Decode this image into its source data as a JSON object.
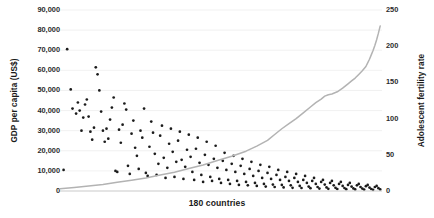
{
  "chart_data": {
    "type": "scatter",
    "title": "",
    "xlabel": "180 countries",
    "ylabel": "GDP per capita (US$)",
    "y2label": "Adolescent fertility rate",
    "grid": true,
    "legend": "none",
    "xlim": [
      0,
      180
    ],
    "ylim": [
      0,
      90000
    ],
    "y2lim": [
      0,
      250
    ],
    "yticks": [
      0,
      10000,
      20000,
      30000,
      40000,
      50000,
      60000,
      70000,
      80000,
      90000
    ],
    "ytick_labels": [
      "0",
      "10,000",
      "20,000",
      "30,000",
      "40,000",
      "50,000",
      "60,000",
      "70,000",
      "80,000",
      "90,000"
    ],
    "y2ticks": [
      0,
      50,
      100,
      150,
      200,
      250
    ],
    "y2tick_labels": [
      "0",
      "50",
      "100",
      "150",
      "200",
      "250"
    ],
    "xticks": [],
    "xtick_labels": [],
    "series": [
      {
        "name": "GDP per capita (US$)",
        "axis": "left",
        "type": "scatter",
        "marker": "circle",
        "color": "#1b1b1b",
        "points": [
          [
            2,
            10500
          ],
          [
            4,
            70500
          ],
          [
            6,
            50500
          ],
          [
            7,
            41000
          ],
          [
            9,
            38500
          ],
          [
            10,
            44000
          ],
          [
            11,
            40000
          ],
          [
            12,
            30000
          ],
          [
            13,
            36500
          ],
          [
            14,
            43000
          ],
          [
            15,
            45500
          ],
          [
            16,
            37000
          ],
          [
            17,
            29500
          ],
          [
            18,
            25500
          ],
          [
            19,
            31500
          ],
          [
            20,
            61500
          ],
          [
            21,
            58000
          ],
          [
            22,
            50000
          ],
          [
            23,
            39500
          ],
          [
            24,
            30000
          ],
          [
            25,
            24500
          ],
          [
            26,
            31000
          ],
          [
            27,
            26000
          ],
          [
            28,
            35500
          ],
          [
            29,
            41500
          ],
          [
            30,
            46500
          ],
          [
            31,
            10000
          ],
          [
            32,
            9500
          ],
          [
            33,
            30500
          ],
          [
            34,
            24000
          ],
          [
            35,
            33000
          ],
          [
            36,
            43500
          ],
          [
            37,
            40500
          ],
          [
            38,
            12500
          ],
          [
            39,
            8500
          ],
          [
            40,
            28500
          ],
          [
            41,
            35000
          ],
          [
            42,
            21500
          ],
          [
            43,
            17500
          ],
          [
            44,
            11000
          ],
          [
            45,
            30000
          ],
          [
            46,
            26500
          ],
          [
            47,
            41000
          ],
          [
            48,
            9000
          ],
          [
            49,
            7500
          ],
          [
            50,
            22000
          ],
          [
            51,
            34500
          ],
          [
            52,
            29000
          ],
          [
            53,
            18500
          ],
          [
            54,
            8000
          ],
          [
            55,
            13500
          ],
          [
            56,
            27500
          ],
          [
            57,
            32500
          ],
          [
            58,
            16500
          ],
          [
            59,
            6500
          ],
          [
            60,
            11500
          ],
          [
            61,
            23500
          ],
          [
            62,
            31000
          ],
          [
            63,
            19500
          ],
          [
            64,
            7000
          ],
          [
            65,
            14500
          ],
          [
            66,
            25000
          ],
          [
            67,
            29500
          ],
          [
            68,
            15500
          ],
          [
            69,
            6000
          ],
          [
            70,
            12000
          ],
          [
            71,
            20500
          ],
          [
            72,
            28000
          ],
          [
            73,
            17000
          ],
          [
            74,
            9500
          ],
          [
            75,
            5500
          ],
          [
            76,
            21000
          ],
          [
            77,
            26500
          ],
          [
            78,
            14000
          ],
          [
            79,
            8000
          ],
          [
            80,
            4500
          ],
          [
            81,
            18000
          ],
          [
            82,
            24500
          ],
          [
            83,
            13000
          ],
          [
            84,
            7000
          ],
          [
            85,
            5000
          ],
          [
            86,
            16000
          ],
          [
            87,
            22500
          ],
          [
            88,
            11500
          ],
          [
            89,
            6000
          ],
          [
            90,
            4000
          ],
          [
            91,
            15000
          ],
          [
            92,
            19000
          ],
          [
            93,
            10500
          ],
          [
            94,
            5500
          ],
          [
            95,
            3500
          ],
          [
            96,
            13500
          ],
          [
            97,
            17500
          ],
          [
            98,
            9500
          ],
          [
            99,
            5000
          ],
          [
            100,
            3000
          ],
          [
            101,
            12500
          ],
          [
            102,
            16000
          ],
          [
            103,
            8500
          ],
          [
            104,
            4500
          ],
          [
            105,
            2800
          ],
          [
            106,
            11000
          ],
          [
            107,
            14500
          ],
          [
            108,
            7500
          ],
          [
            109,
            4000
          ],
          [
            110,
            2500
          ],
          [
            111,
            10000
          ],
          [
            112,
            13000
          ],
          [
            113,
            6500
          ],
          [
            114,
            3500
          ],
          [
            115,
            2200
          ],
          [
            116,
            9000
          ],
          [
            117,
            12000
          ],
          [
            118,
            6000
          ],
          [
            119,
            3200
          ],
          [
            120,
            2000
          ],
          [
            121,
            8000
          ],
          [
            122,
            10500
          ],
          [
            123,
            5500
          ],
          [
            124,
            3000
          ],
          [
            125,
            1800
          ],
          [
            126,
            7000
          ],
          [
            127,
            9500
          ],
          [
            128,
            5000
          ],
          [
            129,
            2800
          ],
          [
            130,
            1600
          ],
          [
            131,
            6500
          ],
          [
            132,
            8500
          ],
          [
            133,
            4500
          ],
          [
            134,
            2500
          ],
          [
            135,
            1500
          ],
          [
            136,
            5500
          ],
          [
            137,
            7500
          ],
          [
            138,
            4000
          ],
          [
            139,
            2200
          ],
          [
            140,
            1400
          ],
          [
            141,
            5000
          ],
          [
            142,
            6500
          ],
          [
            143,
            3500
          ],
          [
            144,
            2000
          ],
          [
            145,
            1200
          ],
          [
            146,
            4500
          ],
          [
            147,
            5500
          ],
          [
            148,
            3200
          ],
          [
            149,
            1800
          ],
          [
            150,
            1100
          ],
          [
            151,
            4000
          ],
          [
            152,
            5000
          ],
          [
            153,
            2800
          ],
          [
            154,
            1600
          ],
          [
            155,
            1000
          ],
          [
            156,
            3500
          ],
          [
            157,
            4500
          ],
          [
            158,
            2500
          ],
          [
            159,
            1500
          ],
          [
            160,
            900
          ],
          [
            161,
            3000
          ],
          [
            162,
            4000
          ],
          [
            163,
            2200
          ],
          [
            164,
            1300
          ],
          [
            165,
            800
          ],
          [
            166,
            2800
          ],
          [
            167,
            3500
          ],
          [
            168,
            2000
          ],
          [
            169,
            1200
          ],
          [
            170,
            700
          ],
          [
            171,
            2400
          ],
          [
            172,
            3000
          ],
          [
            173,
            1700
          ],
          [
            174,
            1000
          ],
          [
            175,
            600
          ],
          [
            176,
            2000
          ],
          [
            177,
            2500
          ],
          [
            178,
            1400
          ],
          [
            179,
            800
          ]
        ]
      },
      {
        "name": "Adolescent fertility rate",
        "axis": "right",
        "type": "line",
        "color": "#b3b3b3",
        "points": [
          [
            0,
            3
          ],
          [
            8,
            5
          ],
          [
            16,
            7
          ],
          [
            24,
            9
          ],
          [
            32,
            12
          ],
          [
            40,
            15
          ],
          [
            48,
            18
          ],
          [
            56,
            22
          ],
          [
            64,
            26
          ],
          [
            72,
            31
          ],
          [
            80,
            36
          ],
          [
            88,
            42
          ],
          [
            96,
            48
          ],
          [
            104,
            55
          ],
          [
            110,
            62
          ],
          [
            116,
            70
          ],
          [
            120,
            78
          ],
          [
            124,
            86
          ],
          [
            128,
            93
          ],
          [
            132,
            100
          ],
          [
            136,
            108
          ],
          [
            140,
            116
          ],
          [
            143,
            122
          ],
          [
            146,
            127
          ],
          [
            148,
            131
          ],
          [
            150,
            133
          ],
          [
            152,
            134
          ],
          [
            155,
            137
          ],
          [
            158,
            142
          ],
          [
            161,
            148
          ],
          [
            163,
            152
          ],
          [
            165,
            156
          ],
          [
            167,
            161
          ],
          [
            169,
            166
          ],
          [
            171,
            172
          ],
          [
            172,
            177
          ],
          [
            173,
            182
          ],
          [
            174,
            188
          ],
          [
            175,
            194
          ],
          [
            176,
            201
          ],
          [
            177,
            209
          ],
          [
            178,
            218
          ],
          [
            179,
            228
          ]
        ]
      }
    ]
  },
  "caption_ghost": ""
}
